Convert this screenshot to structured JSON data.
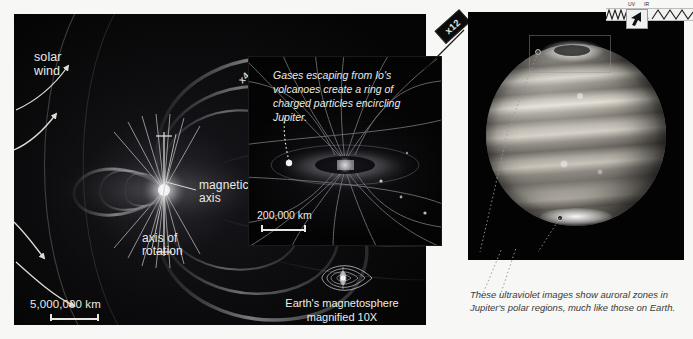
{
  "figure": {
    "background_color": "#f7f7f5",
    "space_color": "#040404"
  },
  "panel_left": {
    "name": "jupiter-magnetosphere-wide",
    "labels": {
      "solar_wind": "solar\nwind",
      "solar_wind_line1": "solar",
      "solar_wind_line2": "wind",
      "magnetic_axis_line1": "magnetic",
      "magnetic_axis_line2": "axis",
      "axis_of_rotation_line1": "axis of",
      "axis_of_rotation_line2": "rotation"
    },
    "scale_bar": {
      "label": "5,000,000 km"
    },
    "magnification_flag": "x4"
  },
  "panel_middle": {
    "name": "io-plasma-torus-inset",
    "caption": "Gases escaping from Io's volcanoes create a ring of charged particles encircling Jupiter.",
    "scale_bar": {
      "label": "200,000 km"
    },
    "magnification_flag": "x12"
  },
  "earth_inset": {
    "name": "earth-magnetosphere-icon",
    "caption_line1": "Earth's magnetosphere",
    "caption_line2": "magnified 10X"
  },
  "panel_right": {
    "name": "jupiter-ultraviolet-photo",
    "caption": "These ultraviolet images show auroral zones in Jupiter's polar regions, much like those on Earth.",
    "features": {
      "north_aurora": "north auroral zone",
      "south_aurora": "south auroral zone"
    }
  },
  "widget": {
    "name": "top-right-toolbar",
    "label_left": "UV",
    "label_right": "IR",
    "cursor": "arrow-cursor"
  },
  "colors": {
    "text_light": "#e9e9e6",
    "text_dark": "#3a3a3a",
    "field_line": "#9a9a9a",
    "accent": "#ffffff"
  }
}
